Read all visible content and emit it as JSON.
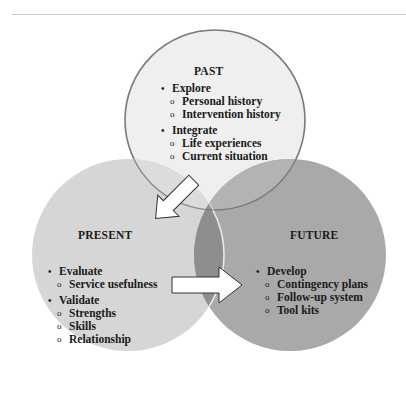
{
  "diagram": {
    "type": "venn",
    "colors": {
      "past_fill": "#efefef",
      "present_fill": "#d6d6d6",
      "future_fill": "#a9a9a9",
      "overlap_fill": "#8e8e8e",
      "outline": "#7a7a7a",
      "arrow_fill": "#ffffff",
      "arrow_stroke": "#333333",
      "top_rule": "#c8c8c8"
    },
    "past": {
      "title": "PAST",
      "items": [
        {
          "label": "Explore",
          "sub": [
            "Personal history",
            "Intervention history"
          ]
        },
        {
          "label": "Integrate",
          "sub": [
            "Life experiences",
            "Current situation"
          ]
        }
      ]
    },
    "present": {
      "title": "PRESENT",
      "items": [
        {
          "label": "Evaluate",
          "sub": [
            "Service usefulness"
          ]
        },
        {
          "label": "Validate",
          "sub": [
            "Strengths",
            "Skills",
            "Relationship"
          ]
        }
      ]
    },
    "future": {
      "title": "FUTURE",
      "items": [
        {
          "label": "Develop",
          "sub": [
            "Contingency plans",
            "Follow-up system",
            "Tool kits"
          ]
        }
      ]
    },
    "arrows": [
      {
        "from": "past",
        "to": "present",
        "direction": "down-left"
      },
      {
        "from": "present",
        "to": "future",
        "direction": "right"
      }
    ],
    "bullet_glyph": "•",
    "sub_bullet_glyph": "o"
  }
}
